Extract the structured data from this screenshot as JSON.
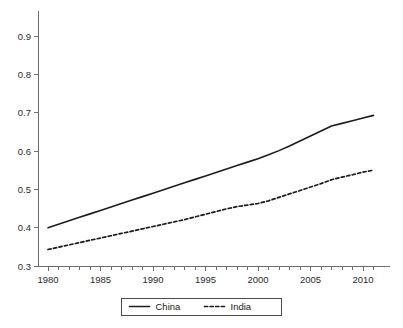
{
  "chart_data": {
    "type": "line",
    "title": "",
    "subtitle": "",
    "xlabel": "",
    "ylabel": "",
    "xlim": [
      1980,
      2011
    ],
    "ylim": [
      0.3,
      0.95
    ],
    "grid": false,
    "legend_position": "bottom-center",
    "x_tick_labels": [
      "1980",
      "1985",
      "1990",
      "1995",
      "2000",
      "2005",
      "2010"
    ],
    "x_tick_values": [
      1980,
      1985,
      1990,
      1995,
      2000,
      2005,
      2010
    ],
    "x_minor_tick_interval": 1,
    "y_tick_labels": [
      "0.3",
      "0.4",
      "0.5",
      "0.6",
      "0.7",
      "0.8",
      "0.9"
    ],
    "y_tick_values": [
      0.3,
      0.4,
      0.5,
      0.6,
      0.7,
      0.8,
      0.9
    ],
    "x": [
      1980,
      1981,
      1982,
      1983,
      1984,
      1985,
      1986,
      1987,
      1988,
      1989,
      1990,
      1991,
      1992,
      1993,
      1994,
      1995,
      1996,
      1997,
      1998,
      1999,
      2000,
      2001,
      2002,
      2003,
      2004,
      2005,
      2006,
      2007,
      2008,
      2009,
      2010,
      2011
    ],
    "series": [
      {
        "name": "China",
        "style": "solid",
        "color": "#1c1c1c",
        "values": [
          0.4,
          0.409,
          0.418,
          0.427,
          0.436,
          0.445,
          0.454,
          0.463,
          0.472,
          0.481,
          0.49,
          0.499,
          0.508,
          0.517,
          0.526,
          0.535,
          0.544,
          0.553,
          0.562,
          0.571,
          0.58,
          0.59,
          0.601,
          0.613,
          0.626,
          0.639,
          0.652,
          0.665,
          0.672,
          0.679,
          0.686,
          0.693
        ]
      },
      {
        "name": "India",
        "style": "dashed",
        "color": "#1c1c1c",
        "values": [
          0.343,
          0.349,
          0.355,
          0.361,
          0.367,
          0.373,
          0.379,
          0.385,
          0.391,
          0.397,
          0.403,
          0.409,
          0.415,
          0.421,
          0.428,
          0.435,
          0.442,
          0.449,
          0.455,
          0.459,
          0.463,
          0.47,
          0.479,
          0.488,
          0.497,
          0.506,
          0.515,
          0.525,
          0.532,
          0.538,
          0.545,
          0.55
        ]
      }
    ]
  },
  "legend": {
    "entries": [
      {
        "label": "China",
        "style": "solid"
      },
      {
        "label": "India",
        "style": "dashed"
      }
    ]
  },
  "colors": {
    "background": "#ffffff",
    "axis": "#6e6e6e",
    "series": "#1c1c1c",
    "text": "#1a1a1a"
  }
}
